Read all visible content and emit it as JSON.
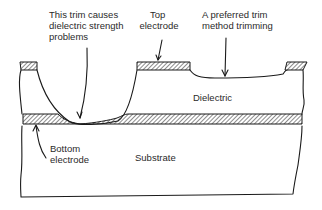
{
  "figure": {
    "labels": {
      "bad_trim": [
        "This trim causes",
        "dielectric strength",
        "problems"
      ],
      "top_electrode": [
        "Top",
        "electrode"
      ],
      "preferred_trim": [
        "A preferred trim",
        "method trimming"
      ],
      "dielectric": "Dielectric",
      "bottom_electrode": [
        "Bottom",
        "electrode"
      ],
      "substrate": "Substrate"
    },
    "colors": {
      "line": "#1a1a1a",
      "text": "#2a2a2a",
      "background": "#ffffff"
    }
  }
}
